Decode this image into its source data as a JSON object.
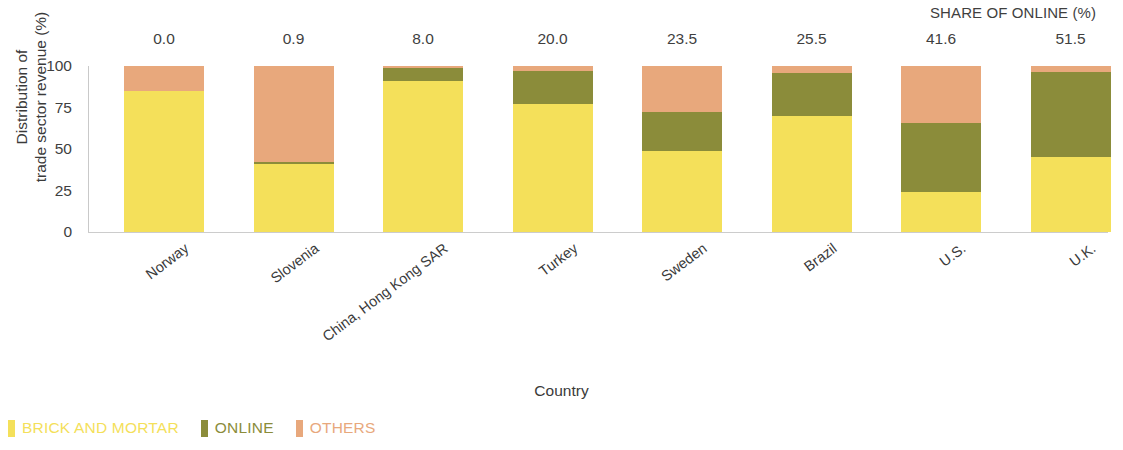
{
  "chart_data": {
    "type": "bar",
    "title": "",
    "subtitle": "",
    "xlabel": "Country",
    "ylabel": "Distribution of\ntrade sector revenue (%)",
    "ylabel_lines": [
      "Distribution of",
      "trade sector revenue (%)"
    ],
    "ylim": [
      0,
      100
    ],
    "yticks": [
      "0",
      "25",
      "50",
      "75",
      "100"
    ],
    "ytick_values": [
      0,
      25,
      50,
      75,
      100
    ],
    "grid": false,
    "stacked": true,
    "legend_position": "bottom-left",
    "categories": [
      "Norway",
      "Slovenia",
      "China, Hong Kong SAR",
      "Turkey",
      "Sweden",
      "Brazil",
      "U.S.",
      "U.K."
    ],
    "series": [
      {
        "name": "BRICK AND MORTAR",
        "color": "#F4E05A",
        "values": [
          85.0,
          41.0,
          91.0,
          77.0,
          49.0,
          70.0,
          24.0,
          45.0
        ]
      },
      {
        "name": "ONLINE",
        "color": "#8B8C3A",
        "values": [
          0.0,
          0.9,
          8.0,
          20.0,
          23.5,
          25.5,
          41.6,
          51.5
        ]
      },
      {
        "name": "OTHERS",
        "color": "#E8A87C",
        "values": [
          15.0,
          58.1,
          1.0,
          3.0,
          27.5,
          4.5,
          34.4,
          3.5
        ]
      }
    ],
    "annotations": {
      "header": "SHARE OF ONLINE (%)",
      "values": [
        "0.0",
        "0.9",
        "8.0",
        "20.0",
        "23.5",
        "25.5",
        "41.6",
        "51.5"
      ]
    }
  },
  "axis": {
    "y_title_line1": "Distribution of",
    "y_title_line2": "trade sector revenue (%)",
    "x_title": "Country"
  },
  "legend": {
    "items": [
      {
        "label": "BRICK AND MORTAR",
        "color": "#F4E05A"
      },
      {
        "label": "ONLINE",
        "color": "#8B8C3A"
      },
      {
        "label": "OTHERS",
        "color": "#E8A87C"
      }
    ]
  }
}
